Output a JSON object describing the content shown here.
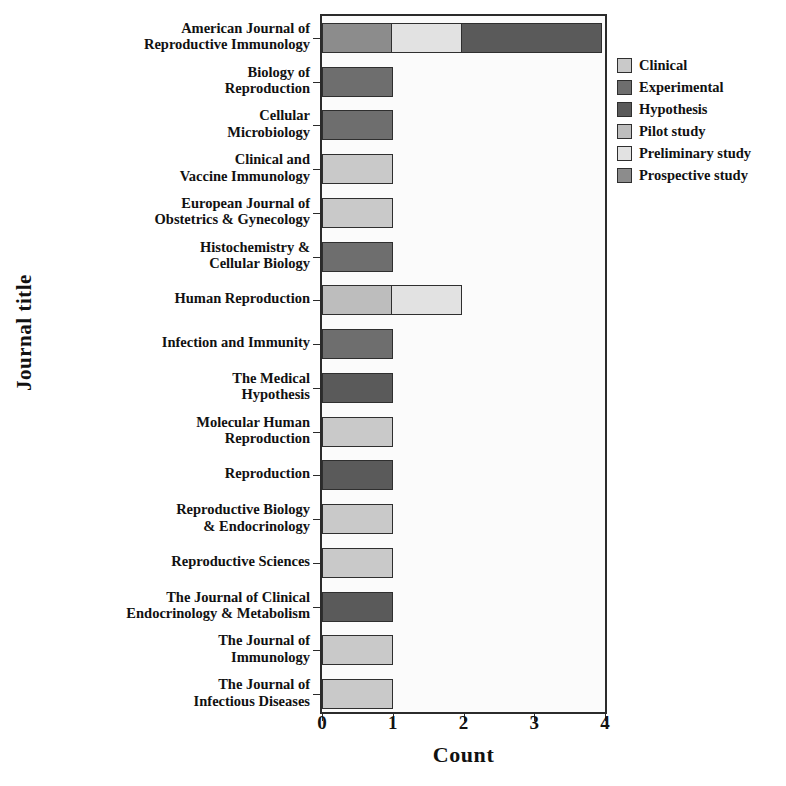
{
  "chart_data": {
    "type": "bar",
    "orientation": "horizontal",
    "stacked": true,
    "title": "",
    "xlabel": "Count",
    "ylabel": "Journal title",
    "xlim": [
      0,
      4
    ],
    "xticks": [
      0,
      1,
      2,
      3,
      4
    ],
    "xticklabels": [
      "0",
      "1",
      "2",
      "3",
      "4"
    ],
    "grid": false,
    "legend_position": "right",
    "legend": [
      {
        "name": "Clinical",
        "color": "#c9c9c9"
      },
      {
        "name": "Experimental",
        "color": "#6e6e6e"
      },
      {
        "name": "Hypothesis",
        "color": "#5a5a5a"
      },
      {
        "name": "Pilot study",
        "color": "#bdbdbd"
      },
      {
        "name": "Preliminary study",
        "color": "#e2e2e2"
      },
      {
        "name": "Prospective study",
        "color": "#8c8c8c"
      }
    ],
    "categories": [
      "American Journal of\nReproductive Immunology",
      "Biology of\nReproduction",
      "Cellular\nMicrobiology",
      "Clinical and\nVaccine Immunology",
      "European Journal of\nObstetrics & Gynecology",
      "Histochemistry &\nCellular Biology",
      "Human Reproduction",
      "Infection and Immunity",
      "The Medical\nHypothesis",
      "Molecular Human\nReproduction",
      "Reproduction",
      "Reproductive Biology\n& Endocrinology",
      "Reproductive Sciences",
      "The Journal of Clinical\nEndocrinology & Metabolism",
      "The Journal of\nImmunology",
      "The Journal of\nInfectious Diseases"
    ],
    "series": [
      {
        "name": "Clinical",
        "values": [
          0,
          0,
          0,
          1,
          1,
          0,
          0,
          0,
          0,
          1,
          0,
          1,
          1,
          0,
          1,
          1
        ]
      },
      {
        "name": "Experimental",
        "values": [
          0,
          1,
          1,
          0,
          0,
          1,
          0,
          1,
          0,
          0,
          0,
          0,
          0,
          0,
          0,
          0
        ]
      },
      {
        "name": "Hypothesis",
        "values": [
          2,
          0,
          0,
          0,
          0,
          0,
          0,
          0,
          1,
          0,
          1,
          0,
          0,
          1,
          0,
          0
        ]
      },
      {
        "name": "Pilot study",
        "values": [
          0,
          0,
          0,
          0,
          0,
          0,
          1,
          0,
          0,
          0,
          0,
          0,
          0,
          0,
          0,
          0
        ]
      },
      {
        "name": "Preliminary study",
        "values": [
          1,
          0,
          0,
          0,
          0,
          0,
          1,
          0,
          0,
          0,
          0,
          0,
          0,
          0,
          0,
          0
        ]
      },
      {
        "name": "Prospective study",
        "values": [
          1,
          0,
          0,
          0,
          0,
          0,
          0,
          0,
          0,
          0,
          0,
          0,
          0,
          0,
          0,
          0
        ]
      }
    ],
    "totals": [
      4,
      1,
      1,
      1,
      1,
      1,
      2,
      1,
      1,
      1,
      1,
      1,
      1,
      1,
      1,
      1
    ],
    "bar_segments": [
      [
        {
          "series": "Prospective study",
          "value": 1
        },
        {
          "series": "Preliminary study",
          "value": 1
        },
        {
          "series": "Hypothesis",
          "value": 2
        }
      ],
      [
        {
          "series": "Experimental",
          "value": 1
        }
      ],
      [
        {
          "series": "Experimental",
          "value": 1
        }
      ],
      [
        {
          "series": "Clinical",
          "value": 1
        }
      ],
      [
        {
          "series": "Clinical",
          "value": 1
        }
      ],
      [
        {
          "series": "Experimental",
          "value": 1
        }
      ],
      [
        {
          "series": "Pilot study",
          "value": 1
        },
        {
          "series": "Preliminary study",
          "value": 1
        }
      ],
      [
        {
          "series": "Experimental",
          "value": 1
        }
      ],
      [
        {
          "series": "Hypothesis",
          "value": 1
        }
      ],
      [
        {
          "series": "Clinical",
          "value": 1
        }
      ],
      [
        {
          "series": "Hypothesis",
          "value": 1
        }
      ],
      [
        {
          "series": "Clinical",
          "value": 1
        }
      ],
      [
        {
          "series": "Clinical",
          "value": 1
        }
      ],
      [
        {
          "series": "Hypothesis",
          "value": 1
        }
      ],
      [
        {
          "series": "Clinical",
          "value": 1
        }
      ],
      [
        {
          "series": "Clinical",
          "value": 1
        }
      ]
    ]
  }
}
